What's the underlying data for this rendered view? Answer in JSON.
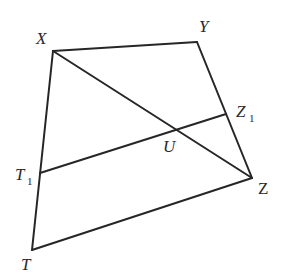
{
  "diagram": {
    "type": "geometry-figure",
    "colors": {
      "stroke": "#262626",
      "label": "#2a2a2a",
      "background": "#ffffff"
    },
    "points": {
      "X": {
        "label": "X",
        "x": 53,
        "y": 51
      },
      "Y": {
        "label": "Y",
        "x": 197,
        "y": 42
      },
      "Z": {
        "label": "Z",
        "x": 252,
        "y": 178
      },
      "T": {
        "label": "T",
        "x": 32,
        "y": 250
      },
      "T1": {
        "label": "T",
        "sub": "1",
        "x": 40,
        "y": 173
      },
      "Z1": {
        "label": "Z",
        "sub": "1",
        "x": 226,
        "y": 114
      },
      "U": {
        "label": "U",
        "x": 176,
        "y": 130
      }
    },
    "segments": [
      {
        "from": "X",
        "to": "Y"
      },
      {
        "from": "Y",
        "to": "Z"
      },
      {
        "from": "Z",
        "to": "T"
      },
      {
        "from": "T",
        "to": "X"
      },
      {
        "from": "X",
        "to": "Z"
      },
      {
        "from": "T1",
        "to": "Z1"
      }
    ],
    "labels": {
      "X": "X",
      "Y": "Y",
      "Z": "Z",
      "T": "T",
      "T1_main": "T",
      "T1_sub": "1",
      "Z1_main": "Z",
      "Z1_sub": "1",
      "U": "U"
    }
  }
}
